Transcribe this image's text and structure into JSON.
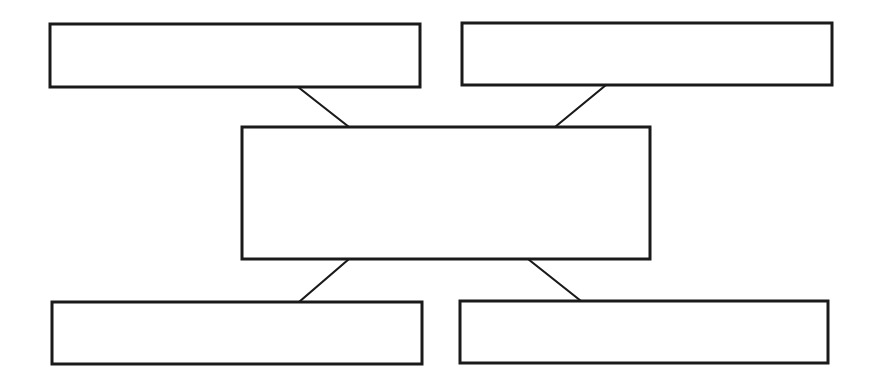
{
  "diagram": {
    "type": "hub-and-spoke",
    "background": "#ffffff",
    "stroke_color": "#1a1a1a",
    "nodes": [
      {
        "id": "top-left",
        "label": "",
        "x": 50,
        "y": 24,
        "w": 370,
        "h": 63
      },
      {
        "id": "top-right",
        "label": "",
        "x": 462,
        "y": 23,
        "w": 370,
        "h": 62
      },
      {
        "id": "center",
        "label": "",
        "x": 242,
        "y": 127,
        "w": 408,
        "h": 132
      },
      {
        "id": "bottom-left",
        "label": "",
        "x": 52,
        "y": 302,
        "w": 370,
        "h": 62
      },
      {
        "id": "bottom-right",
        "label": "",
        "x": 460,
        "y": 301,
        "w": 368,
        "h": 62
      }
    ],
    "edges": [
      {
        "from": "top-left",
        "to": "center",
        "x1": 298,
        "y1": 87,
        "x2": 349,
        "y2": 127
      },
      {
        "from": "top-right",
        "to": "center",
        "x1": 606,
        "y1": 85,
        "x2": 555,
        "y2": 127
      },
      {
        "from": "center",
        "to": "bottom-left",
        "x1": 349,
        "y1": 259,
        "x2": 299,
        "y2": 302
      },
      {
        "from": "center",
        "to": "bottom-right",
        "x1": 528,
        "y1": 259,
        "x2": 581,
        "y2": 301
      }
    ]
  }
}
